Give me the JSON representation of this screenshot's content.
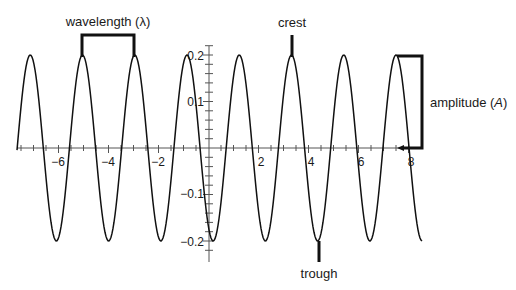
{
  "chart_data": {
    "type": "line",
    "title": "",
    "xlabel": "",
    "ylabel": "",
    "function": "y = 0.2*cos(2*pi*(x - 3.32)/2.09)",
    "amplitude": 0.2,
    "wavelength": 2.09,
    "xlim": [
      -7.6,
      8.6
    ],
    "ylim": [
      -0.22,
      0.22
    ],
    "grid": false,
    "x_ticks": [
      -6,
      -4,
      -2,
      2,
      4,
      6,
      8
    ],
    "y_ticks": [
      0.2,
      0.1,
      -0.1,
      -0.2
    ],
    "crests_x": [
      -7.1,
      -5.03,
      -2.95,
      -0.87,
      1.22,
      3.32,
      5.4,
      7.5
    ],
    "troughs_x": [
      -6.06,
      -3.99,
      -1.91,
      0.17,
      2.27,
      4.4,
      6.44
    ]
  },
  "x_axis": {
    "tick_labels": [
      "−6",
      "−4",
      "−2",
      "2",
      "4",
      "6",
      "8"
    ]
  },
  "y_axis": {
    "tick_labels": [
      "0.2",
      "0.1",
      "−0.1",
      "−0.2"
    ]
  },
  "annotations": {
    "wavelength": "wavelength (λ)",
    "crest": "crest",
    "trough": "trough",
    "amplitude_prefix": "amplitude (",
    "amplitude_symbol": "A",
    "amplitude_suffix": ")"
  }
}
